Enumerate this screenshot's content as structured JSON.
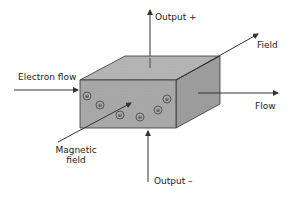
{
  "diagram": {
    "labels": {
      "output_plus": "Output +",
      "output_minus": "Output –",
      "field": "Field",
      "electron_flow": "Electron flow",
      "flow": "Flow",
      "magnetic_field_line1": "Magnetic",
      "magnetic_field_line2": "field"
    },
    "electron_symbol": "e",
    "electron_count": 7,
    "colors": {
      "top_face": "#b4b4b4",
      "front_face": "#a8a8a8",
      "side_face": "#9c9c9c",
      "stroke": "#333333"
    }
  }
}
